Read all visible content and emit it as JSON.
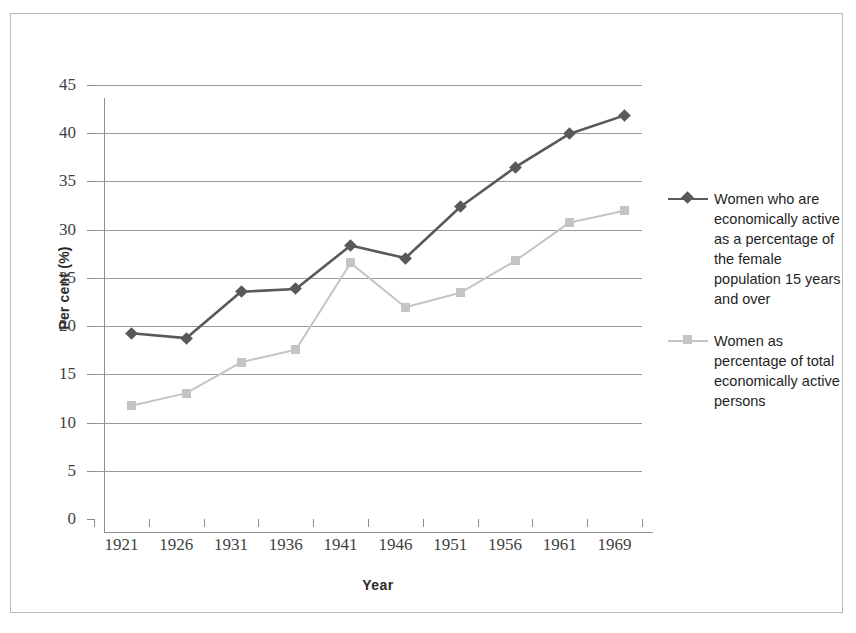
{
  "chart_data": {
    "type": "line",
    "title": "",
    "xlabel": "Year",
    "ylabel": "Per cent (%)",
    "categories": [
      "1921",
      "1926",
      "1931",
      "1936",
      "1941",
      "1946",
      "1951",
      "1956",
      "1961",
      "1969"
    ],
    "ylim": [
      0,
      45
    ],
    "yticks": [
      "0",
      "5",
      "10",
      "15",
      "20",
      "25",
      "30",
      "35",
      "40",
      "45"
    ],
    "ytick_values": [
      0,
      5,
      10,
      15,
      20,
      25,
      30,
      35,
      40,
      45
    ],
    "grid": "horizontal",
    "legend_position": "right",
    "series": [
      {
        "name": "Women who are economically active as a percentage of the female population 15 years and over",
        "marker": "diamond",
        "color": "#595959",
        "values": [
          20.6,
          20.1,
          24.9,
          25.2,
          29.7,
          28.4,
          33.7,
          37.8,
          41.3,
          43.2
        ]
      },
      {
        "name": "Women as percentage of total economically active persons",
        "marker": "square",
        "color": "#c4c4c4",
        "values": [
          13.1,
          14.4,
          17.6,
          18.9,
          27.9,
          23.3,
          24.8,
          28.1,
          32.1,
          33.3
        ]
      }
    ]
  },
  "axes": {
    "y_title": "Per cent (%)",
    "x_title": "Year"
  },
  "legend": {
    "entries": [
      {
        "label": "Women who are economically active as a percentage of the female population 15 years and over",
        "marker": "diamond-marker",
        "color": "#595959"
      },
      {
        "label": "Women as percentage of total economically active persons",
        "marker": "square-marker",
        "color": "#c4c4c4"
      }
    ]
  },
  "colors": {
    "series_1": "#595959",
    "series_2": "#c4c4c4",
    "gridline": "#9a9a9a",
    "axis": "#8d8d8d",
    "frame": "#b9b9b9",
    "text": "#3f3f3f",
    "background": "#ffffff"
  }
}
